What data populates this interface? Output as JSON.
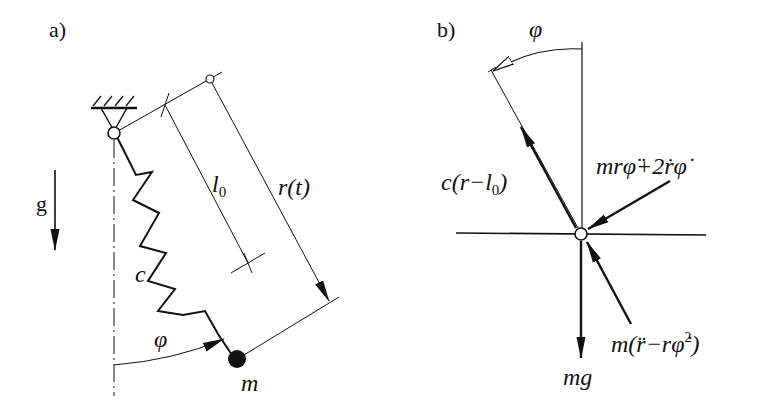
{
  "panel_a": {
    "label": "a)",
    "gravity_label": "g",
    "spring_label": "c",
    "natural_length_label": "l",
    "natural_length_sub": "0",
    "radius_label": "r(t)",
    "angle_label": "φ",
    "mass_label": "m"
  },
  "panel_b": {
    "label": "b)",
    "angle_label": "φ",
    "spring_force_label_pre": "c(r−l",
    "spring_force_label_sub": "0",
    "spring_force_label_post": ")",
    "tangential_inertia_label": "mrφ̈+2ṙφ̇",
    "radial_inertia_label_pre": "m(r̈−rφ̇",
    "radial_inertia_label_sup": "2",
    "radial_inertia_label_post": ")",
    "weight_label": "mg"
  },
  "colors": {
    "ink": "#111111",
    "background": "#ffffff"
  }
}
